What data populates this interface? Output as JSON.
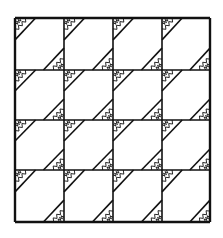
{
  "figure": {
    "type": "quilt-block-line-drawing",
    "grid": {
      "rows": 4,
      "cols": 4
    },
    "bounds": {
      "x0": 15,
      "y0": 18,
      "x1": 210,
      "y1": 222
    },
    "col_lines": [
      15,
      64,
      113,
      162,
      210
    ],
    "row_lines": [
      18,
      70,
      120,
      170,
      222
    ],
    "corner_fraction": 0.42,
    "ink_color": "#111111",
    "paper_color": "#ffffff",
    "motif": "zigzag-hatched corner triangles (top-left and bottom-right of each square)"
  }
}
